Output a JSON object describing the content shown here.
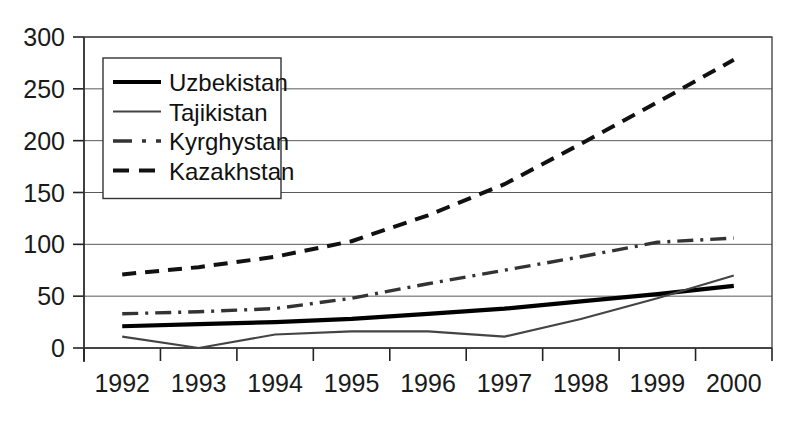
{
  "chart_data": {
    "type": "line",
    "title": "",
    "subtitle": "",
    "xlabel": "",
    "ylabel": "",
    "categories": [
      "1992",
      "1993",
      "1994",
      "1995",
      "1996",
      "1997",
      "1998",
      "1999",
      "2000"
    ],
    "ylim": [
      0,
      300
    ],
    "yticks": [
      0,
      50,
      100,
      150,
      200,
      250,
      300
    ],
    "ytick_labels": [
      "0",
      "50",
      "100",
      "150",
      "200",
      "250",
      "300"
    ],
    "grid": "horizontal",
    "legend_position": "upper-left-inside",
    "series": [
      {
        "name": "Uzbekistan",
        "style": "solid-thick",
        "color": "#000000",
        "values": [
          21,
          23,
          25,
          28,
          33,
          38,
          45,
          52,
          60
        ]
      },
      {
        "name": "Tajikistan",
        "style": "solid-thin",
        "color": "#444444",
        "values": [
          11,
          0,
          13,
          16,
          16,
          11,
          28,
          48,
          70
        ]
      },
      {
        "name": "Kyrghystan",
        "style": "dash-dot",
        "color": "#333333",
        "values": [
          33,
          35,
          38,
          48,
          62,
          75,
          88,
          102,
          106
        ]
      },
      {
        "name": "Kazakhstan",
        "style": "dashed",
        "color": "#111111",
        "values": [
          71,
          78,
          88,
          103,
          128,
          158,
          197,
          237,
          278
        ]
      }
    ]
  },
  "legend": {
    "entries": [
      {
        "label": "Uzbekistan"
      },
      {
        "label": "Tajikistan"
      },
      {
        "label": "Kyrghystan"
      },
      {
        "label": "Kazakhstan"
      }
    ]
  }
}
